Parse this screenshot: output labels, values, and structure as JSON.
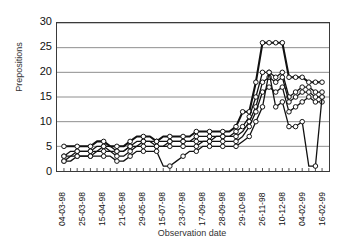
{
  "chart_data": {
    "type": "line",
    "title": "",
    "xlabel": "Observation date",
    "ylabel": "Prepositions",
    "ylim": [
      0,
      30
    ],
    "yticks": [
      30,
      25,
      20,
      15,
      10,
      5,
      0
    ],
    "grid": true,
    "legend_position": "none",
    "marker": "open-circle",
    "x_tick_labels": [
      "04-03-98",
      "25-03-98",
      "15-04-98",
      "21-05-98",
      "29-05-98",
      "15-07-98",
      "23-07-98",
      "17-09-98",
      "28-09-98",
      "29-10-98",
      "26-11-98",
      "10-12-98",
      "04-02-99",
      "16-02-99"
    ],
    "x_label_interval": 3,
    "x": [
      1,
      2,
      3,
      4,
      5,
      6,
      7,
      8,
      9,
      10,
      11,
      12,
      13,
      14,
      15,
      16,
      17,
      18,
      19,
      20,
      21,
      22,
      23,
      24,
      25,
      26,
      27,
      28,
      29,
      30,
      31,
      32,
      33,
      34,
      35,
      36,
      37,
      38,
      39,
      40
    ],
    "series": [
      {
        "name": "Series 1",
        "values": [
          5,
          5,
          5,
          5,
          5,
          6,
          6,
          5,
          5,
          5,
          6,
          7,
          7,
          7,
          6,
          7,
          7,
          7,
          7,
          7,
          8,
          8,
          8,
          8,
          8,
          8,
          9,
          12,
          12,
          18,
          26,
          26,
          26,
          26,
          19,
          19,
          19,
          18,
          18,
          18
        ]
      },
      {
        "name": "Series 2",
        "values": [
          3,
          4,
          4,
          4,
          4,
          5,
          5,
          5,
          4,
          4,
          5,
          6,
          6,
          6,
          6,
          6,
          6,
          6,
          6,
          6,
          7,
          7,
          7,
          7,
          7,
          7,
          8,
          9,
          11,
          15,
          20,
          20,
          19,
          20,
          15,
          16,
          17,
          17,
          16,
          16
        ]
      },
      {
        "name": "Series 3",
        "values": [
          3,
          3,
          4,
          4,
          4,
          4,
          5,
          4,
          4,
          4,
          5,
          5,
          6,
          6,
          5,
          5,
          6,
          6,
          6,
          6,
          6,
          6,
          6,
          7,
          7,
          7,
          7,
          8,
          10,
          13,
          18,
          19,
          18,
          19,
          14,
          15,
          16,
          16,
          15,
          15
        ]
      },
      {
        "name": "Series 4",
        "values": [
          2,
          3,
          3,
          3,
          3,
          4,
          4,
          4,
          3,
          3,
          4,
          5,
          5,
          5,
          5,
          5,
          5,
          5,
          5,
          5,
          5,
          6,
          6,
          6,
          6,
          6,
          6,
          7,
          9,
          12,
          16,
          17,
          16,
          17,
          12,
          13,
          14,
          15,
          14,
          14
        ]
      },
      {
        "name": "Series 5",
        "values": [
          2,
          2,
          3,
          3,
          3,
          3,
          3,
          3,
          2,
          2,
          3,
          4,
          4,
          4,
          4,
          1,
          1,
          2,
          3,
          4,
          4,
          5,
          5,
          5,
          5,
          5,
          5,
          6,
          7,
          10,
          13,
          20,
          13,
          14,
          9,
          9,
          10,
          1,
          1,
          15
        ]
      }
    ]
  },
  "axes": {
    "y_title": "Prepositions",
    "x_title": "Observation date"
  },
  "colors": {
    "line": "#111111",
    "marker_fill": "#ffffff",
    "grid": "#808080",
    "frame": "#3a3a3a"
  }
}
